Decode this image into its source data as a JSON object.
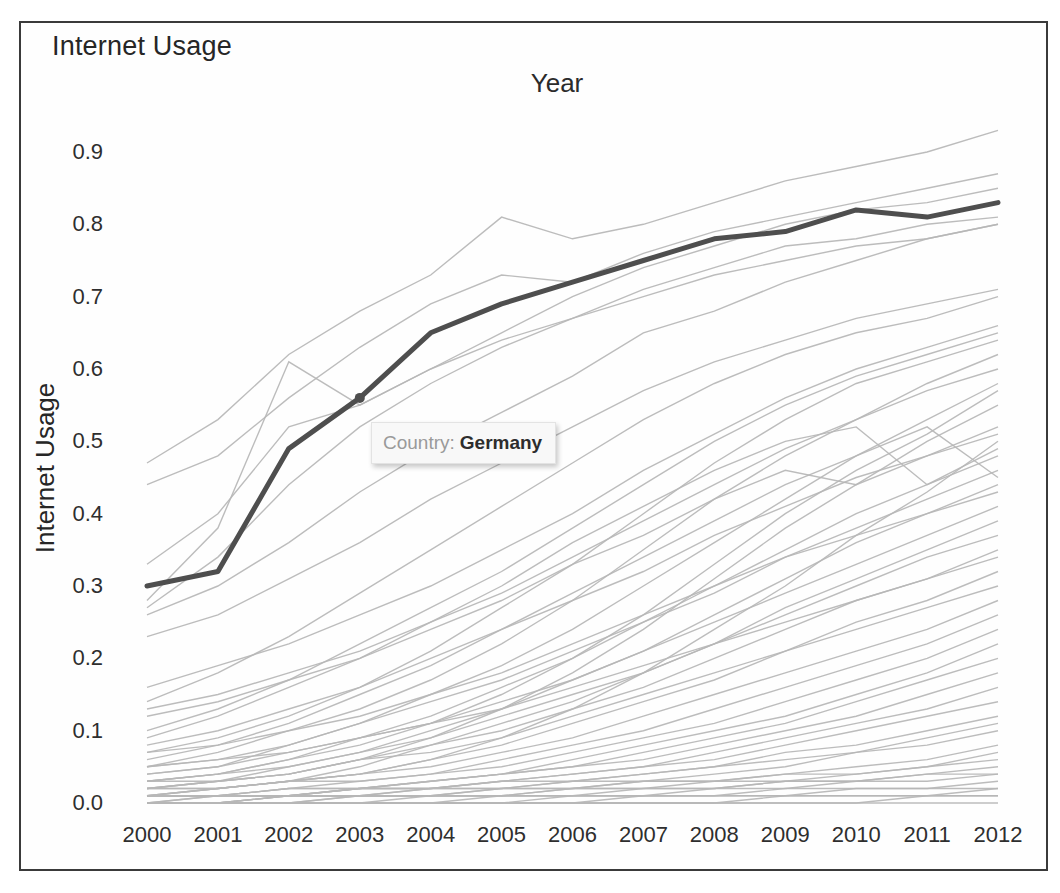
{
  "page": {
    "title": "Internet Usage",
    "x_axis_title": "Year",
    "y_axis_title": "Internet Usage"
  },
  "tooltip": {
    "label": "Country:",
    "value": "Germany"
  },
  "colors": {
    "highlight_line": "#4e4e4e",
    "background_line": "#b6b6b6",
    "frame_border": "#3a3a3a",
    "tooltip_background": "#f8f8f8",
    "tooltip_label_text": "#9a9a9a",
    "text": "#2e2e2e"
  },
  "chart_data": {
    "type": "line",
    "title": "Internet Usage",
    "xlabel": "Year",
    "ylabel": "Internet Usage",
    "x": [
      2000,
      2001,
      2002,
      2003,
      2004,
      2005,
      2006,
      2007,
      2008,
      2009,
      2010,
      2011,
      2012
    ],
    "x_tick_labels": [
      "2000",
      "2001",
      "2002",
      "2003",
      "2004",
      "2005",
      "2006",
      "2007",
      "2008",
      "2009",
      "2010",
      "2011",
      "2012"
    ],
    "y_tick_labels": [
      "0.9",
      "0.8",
      "0.7",
      "0.6",
      "0.5",
      "0.4",
      "0.3",
      "0.2",
      "0.1",
      "0.0"
    ],
    "ylim": [
      0.0,
      0.93
    ],
    "grid": false,
    "legend": false,
    "highlight": {
      "name": "Germany",
      "values": [
        0.3,
        0.32,
        0.49,
        0.56,
        0.65,
        0.69,
        0.72,
        0.75,
        0.78,
        0.79,
        0.82,
        0.81,
        0.83
      ],
      "marker_x": 2003,
      "marker_value": 0.56,
      "tooltip_text": "Country: Germany"
    },
    "background_lines": [
      [
        0.47,
        0.53,
        0.62,
        0.68,
        0.73,
        0.81,
        0.78,
        0.8,
        0.83,
        0.86,
        0.88,
        0.9,
        0.93
      ],
      [
        0.44,
        0.48,
        0.56,
        0.63,
        0.69,
        0.73,
        0.72,
        0.76,
        0.79,
        0.81,
        0.83,
        0.85,
        0.87
      ],
      [
        0.33,
        0.4,
        0.52,
        0.55,
        0.6,
        0.65,
        0.7,
        0.74,
        0.77,
        0.8,
        0.82,
        0.83,
        0.85
      ],
      [
        0.27,
        0.34,
        0.44,
        0.52,
        0.58,
        0.63,
        0.67,
        0.71,
        0.74,
        0.77,
        0.78,
        0.8,
        0.81
      ],
      [
        0.28,
        0.38,
        0.61,
        0.55,
        0.6,
        0.64,
        0.67,
        0.7,
        0.73,
        0.75,
        0.77,
        0.78,
        0.8
      ],
      [
        0.26,
        0.3,
        0.36,
        0.43,
        0.49,
        0.54,
        0.59,
        0.65,
        0.68,
        0.72,
        0.75,
        0.78,
        0.8
      ],
      [
        0.23,
        0.26,
        0.31,
        0.36,
        0.42,
        0.47,
        0.52,
        0.57,
        0.61,
        0.64,
        0.67,
        0.69,
        0.71
      ],
      [
        0.14,
        0.18,
        0.23,
        0.29,
        0.35,
        0.41,
        0.47,
        0.53,
        0.58,
        0.62,
        0.65,
        0.67,
        0.7
      ],
      [
        0.16,
        0.19,
        0.22,
        0.26,
        0.3,
        0.35,
        0.4,
        0.46,
        0.51,
        0.56,
        0.6,
        0.63,
        0.66
      ],
      [
        0.1,
        0.13,
        0.17,
        0.22,
        0.27,
        0.32,
        0.38,
        0.44,
        0.5,
        0.55,
        0.59,
        0.62,
        0.65
      ],
      [
        0.07,
        0.09,
        0.12,
        0.16,
        0.21,
        0.27,
        0.33,
        0.4,
        0.47,
        0.53,
        0.58,
        0.61,
        0.64
      ],
      [
        0.05,
        0.07,
        0.1,
        0.13,
        0.17,
        0.22,
        0.28,
        0.35,
        0.42,
        0.48,
        0.53,
        0.58,
        0.62
      ],
      [
        0.13,
        0.15,
        0.18,
        0.21,
        0.25,
        0.29,
        0.34,
        0.39,
        0.44,
        0.49,
        0.53,
        0.57,
        0.6
      ],
      [
        0.04,
        0.05,
        0.08,
        0.11,
        0.15,
        0.19,
        0.24,
        0.3,
        0.36,
        0.42,
        0.48,
        0.53,
        0.58
      ],
      [
        0.03,
        0.04,
        0.06,
        0.08,
        0.11,
        0.15,
        0.2,
        0.26,
        0.33,
        0.4,
        0.46,
        0.51,
        0.57
      ],
      [
        0.02,
        0.03,
        0.04,
        0.06,
        0.09,
        0.13,
        0.18,
        0.24,
        0.31,
        0.38,
        0.44,
        0.5,
        0.55
      ],
      [
        0.09,
        0.12,
        0.16,
        0.2,
        0.25,
        0.3,
        0.36,
        0.41,
        0.46,
        0.5,
        0.52,
        0.44,
        0.49
      ],
      [
        0.06,
        0.08,
        0.11,
        0.15,
        0.19,
        0.24,
        0.29,
        0.34,
        0.39,
        0.44,
        0.48,
        0.52,
        0.45
      ],
      [
        0.12,
        0.14,
        0.17,
        0.2,
        0.24,
        0.28,
        0.33,
        0.37,
        0.42,
        0.46,
        0.44,
        0.48,
        0.52
      ],
      [
        0.08,
        0.1,
        0.13,
        0.16,
        0.2,
        0.24,
        0.28,
        0.32,
        0.37,
        0.41,
        0.45,
        0.48,
        0.51
      ],
      [
        0.01,
        0.02,
        0.03,
        0.04,
        0.06,
        0.09,
        0.13,
        0.18,
        0.24,
        0.3,
        0.37,
        0.43,
        0.5
      ],
      [
        0.03,
        0.04,
        0.06,
        0.09,
        0.12,
        0.16,
        0.2,
        0.25,
        0.3,
        0.35,
        0.4,
        0.44,
        0.48
      ],
      [
        0.05,
        0.06,
        0.08,
        0.11,
        0.14,
        0.17,
        0.21,
        0.25,
        0.29,
        0.34,
        0.38,
        0.42,
        0.46
      ],
      [
        0.02,
        0.03,
        0.05,
        0.07,
        0.1,
        0.13,
        0.17,
        0.21,
        0.26,
        0.31,
        0.36,
        0.4,
        0.44
      ],
      [
        0.07,
        0.08,
        0.1,
        0.12,
        0.15,
        0.18,
        0.22,
        0.26,
        0.3,
        0.34,
        0.37,
        0.4,
        0.43
      ],
      [
        0.04,
        0.05,
        0.07,
        0.09,
        0.11,
        0.14,
        0.17,
        0.21,
        0.25,
        0.29,
        0.33,
        0.37,
        0.41
      ],
      [
        0.01,
        0.02,
        0.03,
        0.05,
        0.08,
        0.11,
        0.14,
        0.18,
        0.22,
        0.27,
        0.31,
        0.35,
        0.39
      ],
      [
        0.03,
        0.04,
        0.05,
        0.07,
        0.09,
        0.12,
        0.15,
        0.18,
        0.22,
        0.26,
        0.3,
        0.34,
        0.37
      ],
      [
        0.02,
        0.03,
        0.04,
        0.06,
        0.08,
        0.1,
        0.13,
        0.16,
        0.2,
        0.24,
        0.28,
        0.31,
        0.35
      ],
      [
        0.05,
        0.06,
        0.07,
        0.09,
        0.11,
        0.13,
        0.16,
        0.19,
        0.22,
        0.25,
        0.28,
        0.31,
        0.34
      ],
      [
        0.01,
        0.02,
        0.03,
        0.04,
        0.06,
        0.08,
        0.11,
        0.14,
        0.17,
        0.21,
        0.25,
        0.28,
        0.32
      ],
      [
        0.03,
        0.03,
        0.04,
        0.06,
        0.07,
        0.09,
        0.12,
        0.15,
        0.18,
        0.21,
        0.24,
        0.27,
        0.3
      ],
      [
        0.02,
        0.02,
        0.03,
        0.04,
        0.05,
        0.07,
        0.09,
        0.12,
        0.15,
        0.18,
        0.21,
        0.24,
        0.28
      ],
      [
        0.01,
        0.01,
        0.02,
        0.03,
        0.04,
        0.06,
        0.08,
        0.1,
        0.13,
        0.16,
        0.19,
        0.22,
        0.26
      ],
      [
        0.02,
        0.02,
        0.03,
        0.03,
        0.04,
        0.05,
        0.07,
        0.09,
        0.11,
        0.14,
        0.17,
        0.2,
        0.24
      ],
      [
        0.01,
        0.01,
        0.02,
        0.02,
        0.03,
        0.04,
        0.06,
        0.08,
        0.1,
        0.12,
        0.15,
        0.18,
        0.22
      ],
      [
        0.0,
        0.01,
        0.01,
        0.02,
        0.03,
        0.04,
        0.05,
        0.07,
        0.09,
        0.11,
        0.14,
        0.17,
        0.2
      ],
      [
        0.01,
        0.01,
        0.02,
        0.02,
        0.03,
        0.04,
        0.05,
        0.06,
        0.08,
        0.1,
        0.12,
        0.15,
        0.18
      ],
      [
        0.0,
        0.01,
        0.01,
        0.02,
        0.02,
        0.03,
        0.04,
        0.05,
        0.07,
        0.09,
        0.11,
        0.13,
        0.16
      ],
      [
        0.01,
        0.01,
        0.01,
        0.02,
        0.02,
        0.03,
        0.04,
        0.05,
        0.06,
        0.08,
        0.1,
        0.12,
        0.14
      ],
      [
        0.0,
        0.0,
        0.01,
        0.01,
        0.02,
        0.02,
        0.03,
        0.04,
        0.05,
        0.07,
        0.08,
        0.1,
        0.12
      ],
      [
        0.0,
        0.0,
        0.01,
        0.01,
        0.01,
        0.02,
        0.03,
        0.03,
        0.04,
        0.05,
        0.07,
        0.09,
        0.11
      ],
      [
        0.01,
        0.01,
        0.01,
        0.02,
        0.02,
        0.03,
        0.03,
        0.04,
        0.05,
        0.06,
        0.07,
        0.08,
        0.1
      ],
      [
        0.0,
        0.0,
        0.01,
        0.01,
        0.01,
        0.02,
        0.02,
        0.03,
        0.03,
        0.04,
        0.05,
        0.06,
        0.08
      ],
      [
        0.0,
        0.0,
        0.0,
        0.01,
        0.01,
        0.01,
        0.02,
        0.02,
        0.03,
        0.03,
        0.04,
        0.05,
        0.07
      ],
      [
        0.01,
        0.01,
        0.01,
        0.01,
        0.02,
        0.02,
        0.02,
        0.03,
        0.03,
        0.04,
        0.04,
        0.05,
        0.06
      ],
      [
        0.0,
        0.0,
        0.0,
        0.01,
        0.01,
        0.01,
        0.01,
        0.02,
        0.02,
        0.03,
        0.03,
        0.04,
        0.05
      ],
      [
        0.0,
        0.0,
        0.01,
        0.01,
        0.01,
        0.01,
        0.02,
        0.02,
        0.02,
        0.03,
        0.03,
        0.04,
        0.04
      ],
      [
        0.0,
        0.0,
        0.0,
        0.0,
        0.01,
        0.01,
        0.01,
        0.01,
        0.02,
        0.02,
        0.03,
        0.03,
        0.04
      ],
      [
        0.0,
        0.0,
        0.0,
        0.0,
        0.0,
        0.01,
        0.01,
        0.01,
        0.01,
        0.02,
        0.02,
        0.02,
        0.03
      ],
      [
        0.0,
        0.0,
        0.0,
        0.0,
        0.0,
        0.0,
        0.01,
        0.01,
        0.01,
        0.01,
        0.02,
        0.02,
        0.02
      ],
      [
        0.0,
        0.0,
        0.0,
        0.0,
        0.0,
        0.0,
        0.0,
        0.01,
        0.01,
        0.01,
        0.01,
        0.01,
        0.02
      ],
      [
        0.0,
        0.0,
        0.0,
        0.0,
        0.0,
        0.0,
        0.0,
        0.0,
        0.0,
        0.01,
        0.01,
        0.01,
        0.01
      ],
      [
        0.0,
        0.0,
        0.0,
        0.0,
        0.0,
        0.0,
        0.0,
        0.0,
        0.0,
        0.0,
        0.0,
        0.01,
        0.01
      ],
      [
        0.0,
        0.0,
        0.0,
        0.0,
        0.0,
        0.0,
        0.0,
        0.0,
        0.0,
        0.0,
        0.0,
        0.0,
        0.0
      ]
    ]
  }
}
